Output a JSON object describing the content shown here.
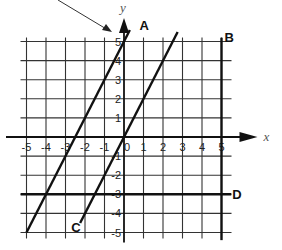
{
  "chart_data": {
    "type": "line",
    "title": "",
    "xlabel": "x",
    "ylabel": "y",
    "xlim": [
      -5,
      5
    ],
    "ylim": [
      -5,
      5
    ],
    "grid": true,
    "x_ticks": [
      "-5",
      "-4",
      "-3",
      "-2",
      "-1",
      "0",
      "1",
      "2",
      "3",
      "4",
      "5"
    ],
    "y_ticks": [
      "5",
      "4",
      "3",
      "2",
      "1",
      "-1",
      "-2",
      "-3",
      "-4",
      "-5"
    ],
    "series": [
      {
        "name": "A",
        "equation": "y = 2x + 5",
        "points": [
          [
            -5,
            -5
          ],
          [
            0.3,
            5.6
          ]
        ]
      },
      {
        "name": "B",
        "equation": "x = 5",
        "points": [
          [
            5,
            5.2
          ],
          [
            5,
            -5.4
          ]
        ]
      },
      {
        "name": "C",
        "equation": "y = 2x",
        "points": [
          [
            -2.25,
            -4.5
          ],
          [
            2.75,
            5.5
          ]
        ]
      },
      {
        "name": "D",
        "equation": "y = -3",
        "points": [
          [
            -5.3,
            -3
          ],
          [
            5.5,
            -3
          ]
        ]
      }
    ],
    "annotations": [
      {
        "type": "pointer-arrow",
        "target": "line A y-intercept region"
      }
    ]
  }
}
